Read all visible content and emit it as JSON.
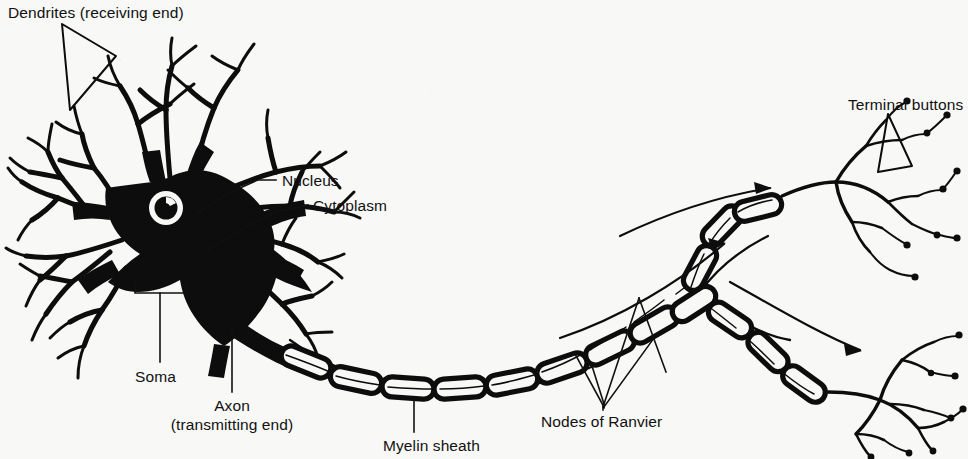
{
  "figure": {
    "background_color": "#f8f8f6",
    "ink_color": "#0d0d0d"
  },
  "labels": {
    "dendrites": "Dendrites (receiving end)",
    "nucleus": "Nucleus",
    "cytoplasm": "Cytoplasm",
    "soma": "Soma",
    "axon_line1": "Axon",
    "axon_line2": "(transmitting end)",
    "myelin_sheath": "Myelin sheath",
    "nodes_of_ranvier": "Nodes of Ranvier",
    "terminal_buttons": "Terminal buttons"
  },
  "parts": [
    {
      "id": "dendrites",
      "label": "Dendrites (receiving end)",
      "pointer": "wedge"
    },
    {
      "id": "nucleus",
      "label": "Nucleus",
      "pointer": "line"
    },
    {
      "id": "cytoplasm",
      "label": "Cytoplasm",
      "pointer": "line"
    },
    {
      "id": "soma",
      "label": "Soma",
      "pointer": "bracket"
    },
    {
      "id": "axon",
      "label": "Axon (transmitting end)",
      "pointer": "line"
    },
    {
      "id": "myelin-sheath",
      "label": "Myelin sheath",
      "pointer": "line"
    },
    {
      "id": "nodes-of-ranvier",
      "label": "Nodes of Ranvier",
      "pointer": "v-leader"
    },
    {
      "id": "terminal-buttons",
      "label": "Terminal buttons",
      "pointer": "wedge"
    }
  ]
}
